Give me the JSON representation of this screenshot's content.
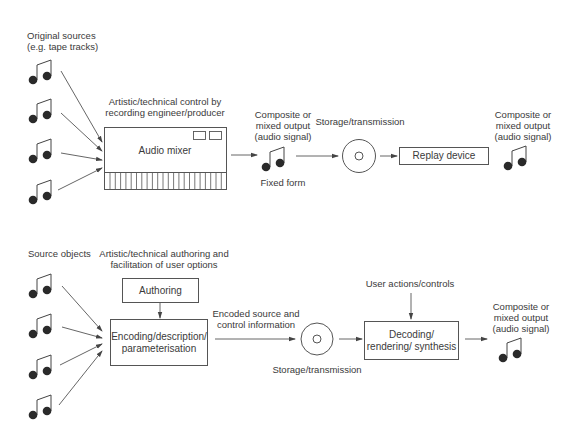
{
  "colors": {
    "line": "#555555",
    "note": "#2a2a2a",
    "text": "#3a3a3a"
  },
  "top": {
    "sources_label_1": "Original sources",
    "sources_label_2": "(e.g. tape tracks)",
    "control_label_1": "Artistic/technical control by",
    "control_label_2": "recording engineer/producer",
    "mixer_label": "Audio mixer",
    "output1_label_1": "Composite or",
    "output1_label_2": "mixed output",
    "output1_label_3": "(audio signal)",
    "fixed_form_label": "Fixed form",
    "storage_label": "Storage/transmission",
    "replay_label": "Replay device",
    "output2_label_1": "Composite or",
    "output2_label_2": "mixed output",
    "output2_label_3": "(audio signal)"
  },
  "bottom": {
    "sources_label": "Source objects",
    "authoring_caption_1": "Artistic/technical authoring and",
    "authoring_caption_2": "facilitation of user options",
    "authoring_label": "Authoring",
    "encoding_label_1": "Encoding/description/",
    "encoding_label_2": "parameterisation",
    "encoded_label_1": "Encoded source and",
    "encoded_label_2": "control information",
    "storage_label": "Storage/transmission",
    "user_actions_label": "User actions/controls",
    "decoding_label_1": "Decoding/",
    "decoding_label_2": "rendering/ synthesis",
    "output_label_1": "Composite or",
    "output_label_2": "mixed output",
    "output_label_3": "(audio signal)"
  },
  "icons": {
    "note": "beamed-eighth-notes-icon",
    "disc": "disc-icon"
  }
}
